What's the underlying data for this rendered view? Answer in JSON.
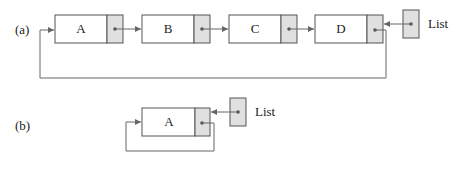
{
  "diagram": {
    "part_a": {
      "label": "(a)",
      "nodes": [
        {
          "value": "A"
        },
        {
          "value": "B"
        },
        {
          "value": "C"
        },
        {
          "value": "D"
        }
      ],
      "pointer_label": "List"
    },
    "part_b": {
      "label": "(b)",
      "nodes": [
        {
          "value": "A"
        }
      ],
      "pointer_label": "List"
    },
    "colors": {
      "line": "#666666",
      "pointer_fill": "#e0e0e0",
      "box_stroke": "#555555"
    }
  }
}
